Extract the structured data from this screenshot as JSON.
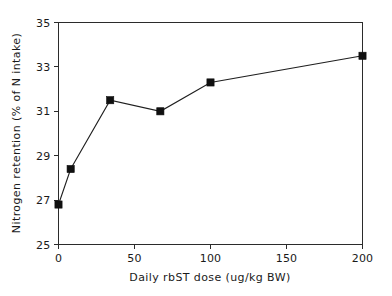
{
  "chart_data": {
    "type": "line",
    "title": "",
    "xlabel": "Daily rbST dose (ug/kg BW)",
    "ylabel": "Nitrogen retention (% of N intake)",
    "xlim": [
      0,
      200
    ],
    "ylim": [
      25,
      35
    ],
    "xticks": [
      0,
      50,
      100,
      150,
      200
    ],
    "xtick_labels": [
      "0",
      "50",
      "100",
      "150",
      "200"
    ],
    "yticks": [
      25,
      27,
      29,
      31,
      33,
      35
    ],
    "ytick_labels": [
      "25",
      "27",
      "29",
      "31",
      "33",
      "35"
    ],
    "grid": false,
    "legend": false,
    "marker": "filled-square",
    "line_color": "#1f1f1f",
    "marker_color": "#101010",
    "series": [
      {
        "name": "Nitrogen retention",
        "x": [
          0,
          8,
          34,
          67,
          100,
          200
        ],
        "values": [
          26.8,
          28.4,
          31.5,
          31.0,
          32.3,
          33.5
        ]
      }
    ]
  }
}
